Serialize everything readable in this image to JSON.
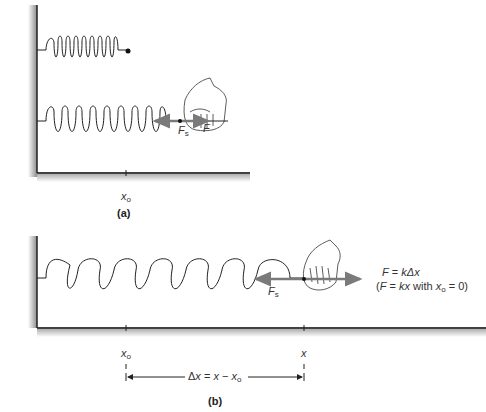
{
  "panel_a": {
    "caption": "(a)",
    "spring_relaxed": {
      "coils": 11,
      "end_marker": "dot"
    },
    "spring_stretched": {
      "coils": 11
    },
    "force_labels": {
      "spring_force": "F",
      "spring_force_sub": "s",
      "applied_force": "F"
    },
    "axis_tick_label": "x",
    "axis_tick_label_sub": "o"
  },
  "panel_b": {
    "caption": "(b)",
    "spring_stretched": {
      "coils": 10
    },
    "force_labels": {
      "spring_force": "F",
      "spring_force_sub": "s"
    },
    "equation_line1": {
      "lhs": "F",
      "eq": " = ",
      "k": "k",
      "rhs": "Δx"
    },
    "equation_line2": {
      "open": "(",
      "lhs": "F",
      "eq": " = ",
      "k": "k",
      "x": "x",
      "with": " with ",
      "x0": "x",
      "x0_sub": "o",
      "tail": " = 0)"
    },
    "axis_tick_labels": [
      {
        "label": "x",
        "sub": "o"
      },
      {
        "label": "x",
        "sub": ""
      }
    ],
    "displacement": {
      "delta": "Δ",
      "x": "x",
      "eq": " = ",
      "x2": "x",
      "minus": " − ",
      "x3": "x",
      "sub": "o"
    }
  },
  "colors": {
    "line": "#222222",
    "arrow": "#7a7a7a",
    "wall_shadow": "#9a9a9a"
  }
}
